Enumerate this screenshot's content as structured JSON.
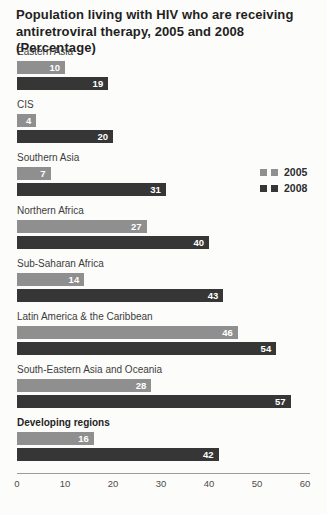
{
  "colors": {
    "series_2005": "#8f8f8f",
    "series_2008": "#363636",
    "axis_line": "#9c9c9c",
    "value_label_text": "#ffffff"
  },
  "chart_data": {
    "type": "bar",
    "orientation": "horizontal",
    "title": "Population living with HIV who are receiving antiretroviral therapy, 2005 and 2008 (Percentage)",
    "categories": [
      "Eastern Asia",
      "CIS",
      "Southern Asia",
      "Northern Africa",
      "Sub-Saharan Africa",
      "Latin America & the Caribbean",
      "South-Eastern Asia and Oceania",
      "Developing regions"
    ],
    "emphasized_category": "Developing regions",
    "series": [
      {
        "name": "2005",
        "values": [
          10,
          4,
          7,
          27,
          14,
          46,
          28,
          16
        ]
      },
      {
        "name": "2008",
        "values": [
          19,
          20,
          31,
          40,
          43,
          54,
          57,
          42
        ]
      }
    ],
    "xlabel": "",
    "ylabel": "",
    "xlim": [
      0,
      60
    ],
    "x_ticks": [
      0,
      10,
      20,
      30,
      40,
      50,
      60
    ],
    "grid": false,
    "legend_position": "right",
    "value_labels": "inside-end"
  }
}
